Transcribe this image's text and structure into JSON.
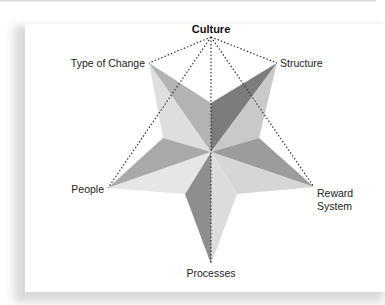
{
  "diagram": {
    "type": "star-model",
    "apex": {
      "label": "Culture",
      "emphasis": "bold"
    },
    "points": [
      {
        "id": "type-of-change",
        "label": "Type of Change"
      },
      {
        "id": "structure",
        "label": "Structure"
      },
      {
        "id": "reward-system",
        "label_line1": "Reward",
        "label_line2": "System"
      },
      {
        "id": "processes",
        "label": "Processes"
      },
      {
        "id": "people",
        "label": "People"
      }
    ],
    "connections": "Culture connected by dotted lines to every star point",
    "colors": {
      "facet_darkest": "#7a7a7a",
      "facet_dark": "#8e8e8e",
      "facet_medium": "#a8a8a8",
      "facet_light": "#cdcdcd",
      "facet_lightest": "#e4e4e4",
      "dotted_line": "#333333"
    }
  }
}
